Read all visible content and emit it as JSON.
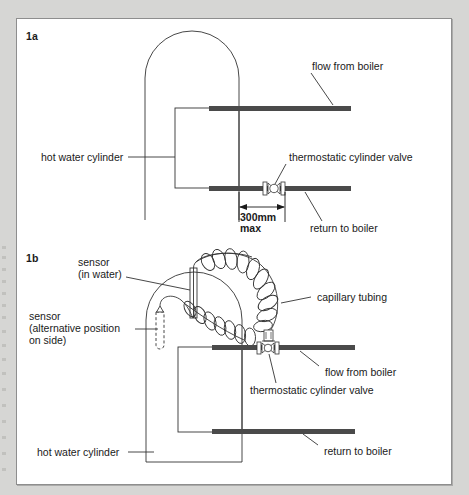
{
  "figure": {
    "background_color": "#d6d6d4",
    "panel_color": "#ffffff",
    "pipe_color": "#4a4a4a",
    "line_color": "#333333",
    "text_color": "#1a1a1a"
  },
  "panels": [
    {
      "id": "1a",
      "label": "1a",
      "labels": {
        "flow_from_boiler": "flow from boiler",
        "hot_water_cylinder": "hot water cylinder",
        "thermostatic_cylinder_valve": "thermostatic cylinder valve",
        "return_to_boiler": "return to boiler",
        "dimension_value": "300mm",
        "dimension_qualifier": "max"
      },
      "components": [
        "hot water cylinder",
        "flow from boiler pipe",
        "return to boiler pipe",
        "thermostatic cylinder valve",
        "300mm max dimension"
      ]
    },
    {
      "id": "1b",
      "label": "1b",
      "labels": {
        "sensor_in_water_line1": "sensor",
        "sensor_in_water_line2": "(in water)",
        "sensor_alt_line1": "sensor",
        "sensor_alt_line2": "(alternative position",
        "sensor_alt_line3": "on side)",
        "capillary_tubing": "capillary tubing",
        "flow_from_boiler": "flow from boiler",
        "thermostatic_cylinder_valve": "thermostatic cylinder valve",
        "return_to_boiler": "return to boiler",
        "hot_water_cylinder": "hot water cylinder"
      },
      "components": [
        "hot water cylinder",
        "sensor in water",
        "sensor alternative position on side",
        "capillary tubing coils",
        "thermostatic cylinder valve with actuator",
        "flow from boiler pipe",
        "return to boiler pipe"
      ]
    }
  ]
}
